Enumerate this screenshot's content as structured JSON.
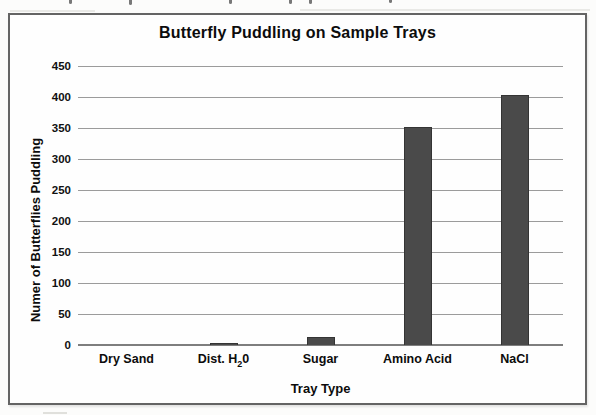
{
  "chart_data": {
    "type": "bar",
    "title": "Butterfly Puddling on Sample Trays",
    "categories": [
      "Dry Sand",
      "Dist. H₂0",
      "Sugar",
      "Amino Acid",
      "NaCl"
    ],
    "values": [
      0,
      4,
      13,
      352,
      403
    ],
    "xlabel": "Tray Type",
    "ylabel": "Numer of Butterflies Puddling",
    "ylim": [
      0,
      450
    ],
    "ytick_step": 50,
    "yticks": [
      0,
      50,
      100,
      150,
      200,
      250,
      300,
      350,
      400,
      450
    ],
    "grid": true,
    "legend": "none",
    "bar_color": "#4a4a4a",
    "gridline_color": "#9b9b9b"
  }
}
